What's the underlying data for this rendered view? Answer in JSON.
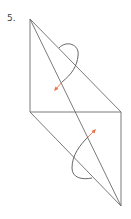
{
  "problem": {
    "number": "5."
  },
  "figure": {
    "line_color": "#6b6b6b",
    "arc_color": "#555555",
    "arrow_color": "#e8734a",
    "vertices": {
      "top": [
        30,
        19
      ],
      "left_mid": [
        30,
        112
      ],
      "right_mid": [
        121,
        112
      ],
      "bottom": [
        121,
        206
      ]
    },
    "segments": [
      {
        "from": "top",
        "to": "left_mid"
      },
      {
        "from": "top",
        "to": "right_mid"
      },
      {
        "from": "top",
        "to": "bottom"
      },
      {
        "from": "left_mid",
        "to": "right_mid"
      },
      {
        "from": "left_mid",
        "to": "bottom"
      },
      {
        "from": "right_mid",
        "to": "bottom"
      }
    ],
    "angle_arcs": [
      {
        "name": "upper-angle-arc",
        "arrow": "upper-left"
      },
      {
        "name": "lower-angle-arc",
        "arrow": "upper-right"
      }
    ]
  }
}
